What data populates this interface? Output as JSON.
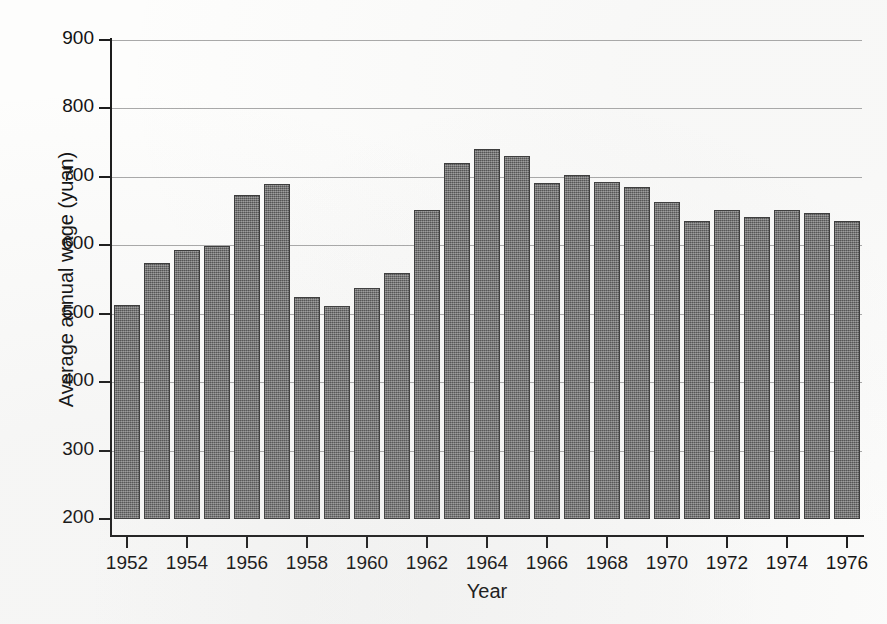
{
  "chart_data": {
    "type": "bar",
    "title": "",
    "xlabel": "Year",
    "ylabel": "Average annual wage (yuan)",
    "xlim": [
      1951.5,
      1976.5
    ],
    "ylim": [
      200,
      900
    ],
    "yticks": [
      200,
      300,
      400,
      500,
      600,
      700,
      800,
      900
    ],
    "ytick_labels": [
      "200",
      "300",
      "400",
      "500",
      "600",
      "700",
      "800",
      "900"
    ],
    "xticks": [
      1952,
      1954,
      1956,
      1958,
      1960,
      1962,
      1964,
      1966,
      1968,
      1970,
      1972,
      1974,
      1976
    ],
    "xtick_labels": [
      "1952",
      "1954",
      "1956",
      "1958",
      "1960",
      "1962",
      "1964",
      "1966",
      "1968",
      "1970",
      "1972",
      "1974",
      "1976"
    ],
    "grid": "horizontal",
    "legend": "none",
    "bar_color": "#6e6e6e",
    "bar_edge_color": "#3a3a3a",
    "categories": [
      1952,
      1953,
      1954,
      1955,
      1956,
      1957,
      1958,
      1959,
      1960,
      1961,
      1962,
      1963,
      1964,
      1965,
      1966,
      1967,
      1968,
      1969,
      1970,
      1971,
      1972,
      1973,
      1974,
      1975,
      1976
    ],
    "values": [
      513,
      574,
      593,
      599,
      674,
      690,
      525,
      512,
      537,
      560,
      652,
      721,
      741,
      730,
      691,
      703,
      692,
      685,
      663,
      635,
      652,
      642,
      651,
      647,
      636
    ]
  },
  "axes": {
    "y_title": "Average annual wage (yuan)",
    "x_title": "Year"
  }
}
